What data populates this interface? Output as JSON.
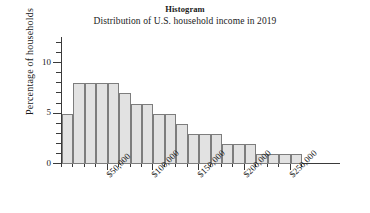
{
  "chart_data": {
    "type": "bar",
    "title": "Histogram",
    "subtitle": "Distribution of U.S. household income in 2019",
    "xlabel": "",
    "ylabel": "Percentage of households",
    "grid": false,
    "legend": "none",
    "bin_width": 12500,
    "xlim": [
      0,
      280000
    ],
    "ylim": [
      0,
      12.5
    ],
    "x_major_ticks": [
      50000,
      100000,
      150000,
      200000,
      250000
    ],
    "x_tick_labels": [
      "$50,000",
      "$100,000",
      "$150,000",
      "$200,000",
      "$250,000"
    ],
    "y_major_ticks": [
      0,
      5,
      10
    ],
    "y_tick_labels": [
      "0",
      "5",
      "10"
    ],
    "y_minor_tick_step": 1,
    "bin_starts": [
      0,
      12500,
      25000,
      37500,
      50000,
      62500,
      75000,
      87500,
      100000,
      112500,
      125000,
      137500,
      150000,
      162500,
      175000,
      187500,
      200000,
      212500,
      225000,
      237500,
      250000
    ],
    "categories": [
      "0",
      "12.5k",
      "25k",
      "37.5k",
      "50k",
      "62.5k",
      "75k",
      "87.5k",
      "100k",
      "112.5k",
      "125k",
      "137.5k",
      "150k",
      "162.5k",
      "175k",
      "187.5k",
      "200k",
      "212.5k",
      "225k",
      "237.5k",
      "250k"
    ],
    "values": [
      5,
      8,
      8,
      8,
      8,
      7,
      6,
      6,
      5,
      5,
      4,
      3,
      3,
      3,
      2,
      2,
      2,
      1,
      1,
      1,
      1
    ],
    "bar_fill_color": "#e2e2e2",
    "bar_edge_color": "#7d7d7d",
    "axis_color": "#3a3a3a"
  }
}
